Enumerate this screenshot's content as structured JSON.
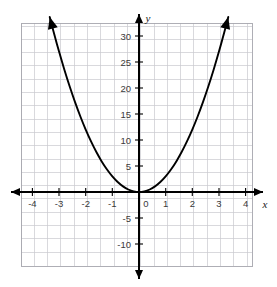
{
  "chart_data": {
    "type": "line",
    "title": "",
    "subtitle": "",
    "xlabel": "x",
    "ylabel": "y",
    "equation": "y = 3x^2",
    "xlim": [
      -4.75,
      4.75
    ],
    "ylim": [
      -13.5,
      33.5
    ],
    "grid": true,
    "grid_step_x": 0.5,
    "grid_step_y": 2.5,
    "legend": "none",
    "x_tick_labels": [
      "-4",
      "-3",
      "-2",
      "-1",
      "0",
      "1",
      "2",
      "3",
      "4"
    ],
    "x_tick_values": [
      -4,
      -3,
      -2,
      -1,
      0,
      1,
      2,
      3,
      4
    ],
    "y_tick_labels": [
      "30",
      "25",
      "20",
      "15",
      "10",
      "5",
      "-5",
      "-10"
    ],
    "y_tick_values": [
      30,
      25,
      20,
      15,
      10,
      5,
      -5,
      -10
    ],
    "origin_label": "0",
    "series": [
      {
        "name": "y = 3x^2",
        "arrow_start": true,
        "arrow_end": true,
        "x": [
          -3.35,
          -3.2,
          -3.0,
          -2.8,
          -2.6,
          -2.4,
          -2.2,
          -2.0,
          -1.8,
          -1.6,
          -1.4,
          -1.2,
          -1.0,
          -0.8,
          -0.6,
          -0.4,
          -0.2,
          0.0,
          0.2,
          0.4,
          0.6,
          0.8,
          1.0,
          1.2,
          1.4,
          1.6,
          1.8,
          2.0,
          2.2,
          2.4,
          2.6,
          2.8,
          3.0,
          3.2,
          3.35
        ],
        "y": [
          33.67,
          30.72,
          27.0,
          23.52,
          20.28,
          17.28,
          14.52,
          12.0,
          9.72,
          7.68,
          5.88,
          4.32,
          3.0,
          1.92,
          1.08,
          0.48,
          0.12,
          0.0,
          0.12,
          0.48,
          1.08,
          1.92,
          3.0,
          4.32,
          5.88,
          7.68,
          9.72,
          12.0,
          14.52,
          17.28,
          20.28,
          23.52,
          27.0,
          30.72,
          33.67
        ]
      }
    ],
    "colors": {
      "curve": "#000000",
      "axis": "#000000",
      "grid_minor": "#c9c9cf",
      "grid_major": "#9a9aa2",
      "grid_border": "#9a9aa2",
      "tick_text": "#3a3a3a",
      "background": "#ffffff"
    }
  }
}
